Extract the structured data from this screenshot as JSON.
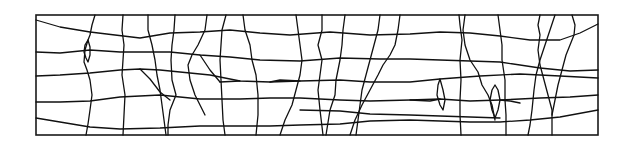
{
  "diagram": {
    "type": "crack-pattern",
    "stroke_color": "#111111",
    "background": "#ffffff",
    "frame": {
      "x": 36,
      "y": 15,
      "width": 562,
      "height": 120
    },
    "horizontal_cracks": [
      "36,20 60,27 90,32 140,38 170,33 200,32 230,30 260,33 290,35 330,32 370,35 410,34 440,32 470,33 500,36 530,40 560,40 580,33 598,24",
      "36,52 60,53 90,50 120,52 140,52 170,52 200,55 230,57 260,60 300,61 340,58 380,59 410,59 440,60 470,61 500,62 540,68 570,71 598,70",
      "36,76 60,75 90,73 120,70 140,69 160,70 190,73 210,75 240,81 270,82 300,81 340,80 370,82 410,82 440,79 480,76 520,74 560,76 598,78",
      "36,102 60,102 90,101 120,97 160,95 200,99 240,99 270,98 300,98 340,100 370,101 410,100 440,99 470,101 500,100 540,98 570,97 598,95",
      "36,118 60,122 90,127 120,129 160,128 200,126 240,126 270,126 300,125 340,124 370,121 410,120 440,121 470,122 500,122 530,120 560,117 598,110",
      "140,69 150,79 160,92 170,100",
      "200,55 210,70 220,82",
      "220,82 240,81",
      "270,82 280,80 300,81",
      "410,100 430,101 440,99",
      "500,100 510,101 520,103",
      "300,110 340,111 370,114 410,115 440,116 470,117 500,118"
    ],
    "vertical_cracks": [
      "95,15 92,25 90,35 88,40 85,50 84,62 87,70 90,80 92,95 90,110 88,124 86,135",
      "88,40 85,45 84,52 86,58 88,62 90,55 90,47 88,40",
      "123,15 122,30 124,45 123,60 122,75 125,95 124,115 123,135",
      "148,15 148,30 152,45 155,60 157,75 160,90 162,105 164,120 166,135",
      "175,15 174,30 172,45 171,60 172,80 176,95 170,110 168,125 168,135",
      "207,15 205,30 198,45 192,55 188,65 190,80 195,95 200,105 205,115",
      "226,15 222,30 221,45 220,60 221,80 222,100 223,120 225,135",
      "243,15 245,30 250,45 252,60 256,75 258,95 258,115 256,135",
      "296,15 298,30 300,45 302,60 300,75 296,90 292,105 285,120 280,135",
      "322,15 322,30 318,45 322,60 320,75 318,90 320,110 323,135",
      "345,15 343,30 342,45 340,60 338,70 336,80 335,95 330,110 326,135",
      "380,15 378,30 374,45 370,60 366,75 362,90 360,105 358,120 356,135",
      "400,15 398,30 395,45 390,55 383,65 378,75 370,90 362,105 355,120 350,135",
      "459,15 460,25 462,40 460,60 461,80 460,100 460,115 461,135",
      "465,15 463,30 465,45 470,60 478,72 482,85 488,95 492,105 495,120",
      "498,15 500,30 502,45 502,60 505,80 505,100 506,115 506,135",
      "540,15 538,25 540,35 538,50 540,65 544,80 548,95 552,110 552,125 552,135",
      "555,15 550,30 545,45 540,60 536,75 534,90 532,110 530,125 528,135",
      "572,15 575,25 574,35 570,45 566,55 562,70 558,85 555,100 552,115",
      "495,85 492,90 490,100 492,110 495,118 498,110 500,100 498,90 495,85",
      "440,79 438,85 437,95 440,105 443,110 445,100 443,90 440,79"
    ]
  }
}
